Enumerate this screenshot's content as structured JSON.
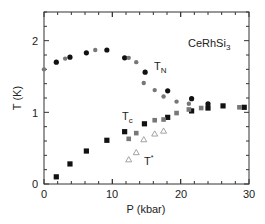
{
  "chart_data": {
    "type": "scatter",
    "title": "",
    "annotation": "CeRhSi3",
    "xlabel": "P (kbar)",
    "ylabel": "T (K)",
    "xlim": [
      0,
      30
    ],
    "ylim": [
      0,
      2.4
    ],
    "xticks": [
      0,
      10,
      20,
      30
    ],
    "yticks": [
      0,
      1,
      2
    ],
    "grid": false,
    "legend": "none",
    "labels": [
      {
        "text": "T",
        "sub": "N",
        "x": 16.0,
        "y": 1.6
      },
      {
        "text": "T",
        "sub": "c",
        "x": 11.5,
        "y": 0.88
      },
      {
        "text": "T",
        "sup": "*",
        "x": 15.0,
        "y": 0.33
      }
    ],
    "series": [
      {
        "name": "T_N (filled black circles)",
        "marker": "circle",
        "color": "#111111",
        "filled": true,
        "x": [
          1.8,
          3.8,
          6.2,
          9.2,
          11.8,
          14.8,
          18.1,
          21.6,
          24.0
        ],
        "y": [
          1.7,
          1.77,
          1.83,
          1.87,
          1.76,
          1.56,
          1.3,
          1.19,
          1.12
        ]
      },
      {
        "name": "T_N (gray circles)",
        "marker": "circle",
        "color": "#777777",
        "filled": true,
        "x": [
          0.0,
          3.1,
          7.5,
          12.4,
          13.5,
          14.6,
          16.2,
          17.5,
          19.4,
          21.2
        ],
        "y": [
          1.6,
          1.75,
          1.87,
          1.76,
          1.7,
          1.41,
          1.31,
          1.22,
          1.15,
          1.12
        ]
      },
      {
        "name": "T_c (filled black squares)",
        "marker": "square",
        "color": "#111111",
        "filled": true,
        "x": [
          1.8,
          3.8,
          6.2,
          9.2,
          11.8,
          14.7,
          18.1,
          21.6,
          24.0,
          26.2,
          29.3
        ],
        "y": [
          0.1,
          0.28,
          0.46,
          0.61,
          0.73,
          0.84,
          0.93,
          1.02,
          1.06,
          1.09,
          1.07
        ]
      },
      {
        "name": "T_c (gray squares)",
        "marker": "square",
        "color": "#777777",
        "filled": true,
        "x": [
          12.4,
          13.5,
          16.2,
          17.5,
          19.4,
          21.2,
          23.0,
          28.6
        ],
        "y": [
          0.63,
          0.71,
          0.89,
          0.9,
          0.99,
          1.04,
          1.06,
          1.07
        ]
      },
      {
        "name": "T* (open triangles)",
        "marker": "triangle",
        "color": "#999999",
        "filled": false,
        "x": [
          12.4,
          13.5,
          14.6,
          16.2,
          17.5
        ],
        "y": [
          0.34,
          0.44,
          0.62,
          0.7,
          0.74
        ]
      }
    ]
  },
  "axes": {
    "x_title": "P (kbar)",
    "y_title": "T (K)",
    "x_tick_labels": [
      "0",
      "10",
      "20",
      "30"
    ],
    "y_tick_labels": [
      "0",
      "1",
      "2"
    ]
  },
  "annotations": {
    "compound": "CeRhSi",
    "compound_sub": "3",
    "tn_main": "T",
    "tn_sub": "N",
    "tc_main": "T",
    "tc_sub": "c",
    "tstar_main": "T",
    "tstar_sup": "*"
  }
}
